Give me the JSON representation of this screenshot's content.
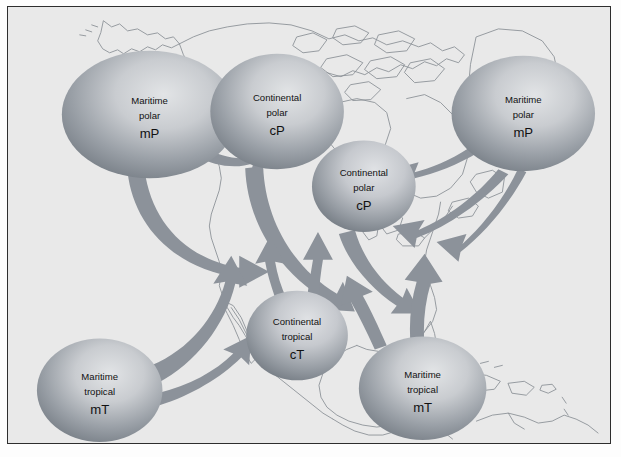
{
  "figure": {
    "background_color": "#e9e9e9",
    "border_color": "#2e2e2e",
    "coastline_color": "#8a8f96",
    "arrow_color": "#8b9199",
    "ellipse_light": "#d8dadd",
    "ellipse_dark": "#7d838b",
    "text_color": "#111111"
  },
  "air_masses": [
    {
      "id": "mp-west",
      "name": "maritime-polar-west",
      "line1": "Maritime",
      "line2": "polar",
      "code": "mP",
      "cx": 142,
      "cy": 108,
      "rx": 88,
      "ry": 64
    },
    {
      "id": "cp-north",
      "name": "continental-polar-north",
      "line1": "Continental",
      "line2": "polar",
      "code": "cP",
      "cx": 270,
      "cy": 105,
      "rx": 67,
      "ry": 58
    },
    {
      "id": "mp-east",
      "name": "maritime-polar-east",
      "line1": "Maritime",
      "line2": "polar",
      "code": "mP",
      "cx": 517,
      "cy": 107,
      "rx": 72,
      "ry": 58
    },
    {
      "id": "cp-central",
      "name": "continental-polar-central",
      "line1": "Continental",
      "line2": "polar",
      "code": "cP",
      "cx": 357,
      "cy": 180,
      "rx": 52,
      "ry": 46
    },
    {
      "id": "ct-central",
      "name": "continental-tropical",
      "line1": "Continental",
      "line2": "tropical",
      "code": "cT",
      "cx": 290,
      "cy": 330,
      "rx": 51,
      "ry": 45
    },
    {
      "id": "mt-west",
      "name": "maritime-tropical-west",
      "line1": "Maritime",
      "line2": "tropical",
      "code": "mT",
      "cx": 92,
      "cy": 385,
      "rx": 63,
      "ry": 52
    },
    {
      "id": "mt-east",
      "name": "maritime-tropical-east",
      "line1": "Maritime",
      "line2": "tropical",
      "code": "mT",
      "cx": 416,
      "cy": 383,
      "rx": 64,
      "ry": 52
    }
  ],
  "flow_arrows": [
    {
      "id": "a1",
      "name": "arrow-mp-west-to-cp-north",
      "from": "maritime-polar-west",
      "to": "continental-polar-north",
      "direction": "east"
    },
    {
      "id": "a2",
      "name": "arrow-mp-west-to-interior",
      "from": "maritime-polar-west",
      "to": "interior",
      "direction": "southeast-then-east"
    },
    {
      "id": "a3",
      "name": "arrow-cp-north-southeast",
      "from": "continental-polar-north",
      "to": "southeast",
      "direction": "southeast"
    },
    {
      "id": "a4",
      "name": "arrow-cp-central-southeast",
      "from": "continental-polar-central",
      "to": "southeast",
      "direction": "southeast"
    },
    {
      "id": "a5",
      "name": "arrow-mp-east-southwest-upper",
      "from": "maritime-polar-east",
      "to": "southwest",
      "direction": "west-southwest"
    },
    {
      "id": "a6",
      "name": "arrow-mp-east-southwest-lower",
      "from": "maritime-polar-east",
      "to": "southwest",
      "direction": "southwest"
    },
    {
      "id": "a7",
      "name": "arrow-mt-west-north",
      "from": "maritime-tropical-west",
      "to": "northwest-interior",
      "direction": "north-northeast"
    },
    {
      "id": "a8",
      "name": "arrow-mt-west-northeast",
      "from": "maritime-tropical-west",
      "to": "interior",
      "direction": "northeast"
    },
    {
      "id": "a9",
      "name": "arrow-ct-north-left",
      "from": "continental-tropical",
      "to": "north",
      "direction": "north"
    },
    {
      "id": "a10",
      "name": "arrow-ct-north-right",
      "from": "continental-tropical",
      "to": "north",
      "direction": "north"
    },
    {
      "id": "a11",
      "name": "arrow-mt-east-north",
      "from": "maritime-tropical-east",
      "to": "north",
      "direction": "north"
    },
    {
      "id": "a12",
      "name": "arrow-mt-east-northwest",
      "from": "maritime-tropical-east",
      "to": "interior",
      "direction": "north-northwest"
    }
  ]
}
